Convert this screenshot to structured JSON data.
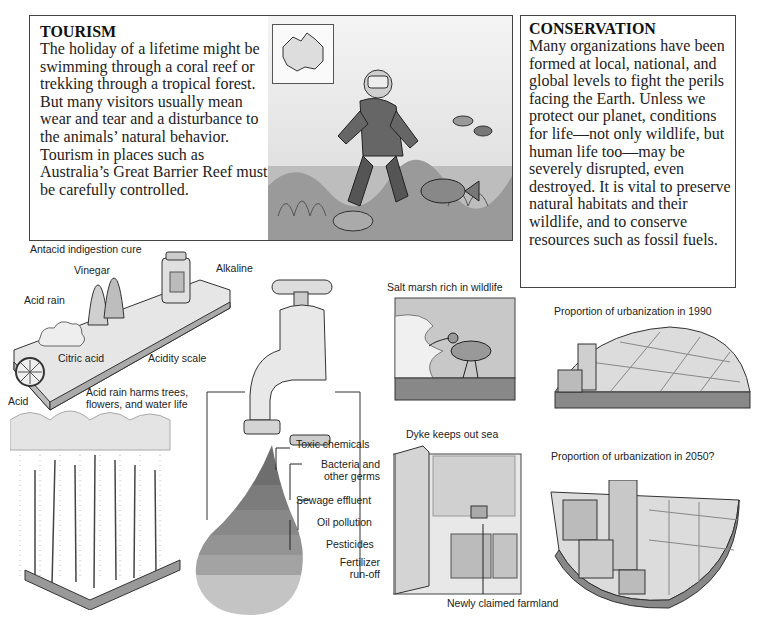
{
  "tourism": {
    "heading": "TOURISM",
    "body": "The holiday of a lifetime might be swimming through a coral reef or trekking through a tropical forest. But many visitors usually mean wear and tear and a disturbance to the animals’ natural behavior. Tourism in places such as Australia’s Great Barrier Reef must be carefully controlled.",
    "illustration": "diver-on-coral-reef-with-australia-map-inset"
  },
  "conservation": {
    "heading": "CONSERVATION",
    "body": "Many organizations have been formed at local, national, and global levels to fight the perils facing the Earth. Unless we protect our planet, conditions for life—not only wildlife, but human life too—may be severely disrupted, even destroyed. It is vital to preserve natural habitats and their wildlife, and to conserve resources such as fossil fuels."
  },
  "acidity": {
    "labels": {
      "antacid": "Antacid indigestion cure",
      "vinegar": "Vinegar",
      "alkaline": "Alkaline",
      "acid_rain": "Acid rain",
      "citric_acid": "Citric acid",
      "acidity_scale": "Acidity scale",
      "acid": "Acid",
      "harm": "Acid rain harms trees, flowers, and water life"
    },
    "harm_lines": [
      "Acid rain harms trees,",
      "flowers, and water life"
    ]
  },
  "water_pollution": {
    "layers": [
      {
        "label": "Toxic chemicals",
        "color": "#6e6e6e"
      },
      {
        "label": "Bacteria and other germs",
        "color": "#7c7c7c"
      },
      {
        "label": "Sewage effluent",
        "color": "#888888"
      },
      {
        "label": "Oil pollution",
        "color": "#949494"
      },
      {
        "label": "Pesticides",
        "color": "#a3a3a3"
      },
      {
        "label": "Fertilizer run-off",
        "color": "#bdbdbd"
      }
    ],
    "bacteria_lines": [
      "Bacteria and",
      "other germs"
    ],
    "fertilizer_lines": [
      "Fertilizer",
      "run-off"
    ]
  },
  "wetlands": {
    "salt_marsh": "Salt marsh rich in wildlife",
    "dyke": "Dyke keeps out sea",
    "farmland": "Newly claimed farmland"
  },
  "urbanization": {
    "year1990": "Proportion of urbanization in 1990",
    "year2050": "Proportion of urbanization in 2050?"
  }
}
